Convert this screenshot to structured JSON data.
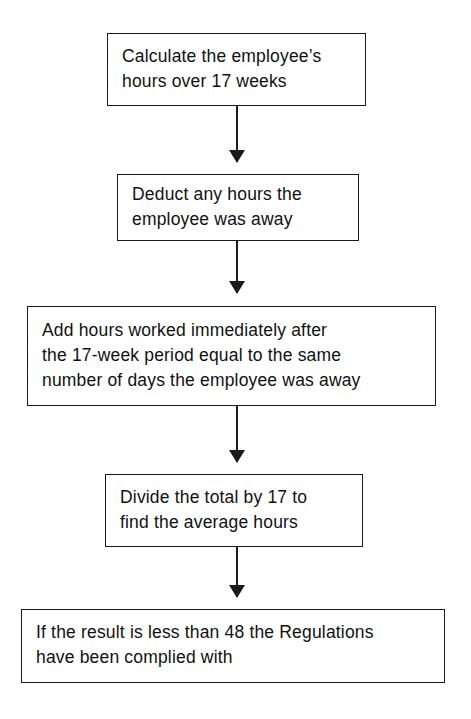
{
  "diagram": {
    "type": "flowchart",
    "orientation": "top-to-bottom",
    "background_color": "#ffffff",
    "line_color": "#1a1a1a",
    "text_color": "#111111",
    "nodes": [
      {
        "id": "node-1",
        "shape": "rectangle",
        "name": "calculate-hours-step",
        "lines": [
          "Calculate the employee’s",
          "hours over 17 weeks"
        ]
      },
      {
        "id": "node-2",
        "shape": "rectangle",
        "name": "deduct-away-hours-step",
        "lines": [
          "Deduct any hours the",
          "employee was away"
        ]
      },
      {
        "id": "node-3",
        "shape": "rectangle",
        "name": "add-hours-worked-step",
        "lines": [
          "Add hours worked immediately after",
          "the 17-week period equal to the same",
          "number of days the employee was away"
        ]
      },
      {
        "id": "node-4",
        "shape": "rectangle",
        "name": "divide-total-step",
        "lines": [
          "Divide the total by 17 to",
          "find the average hours"
        ]
      },
      {
        "id": "node-5",
        "shape": "rectangle",
        "name": "result-compliance-step",
        "lines": [
          "If the result is less than 48 the Regulations",
          "have been complied with"
        ]
      }
    ],
    "connectors": [
      {
        "id": "connector-1",
        "from": "node-1",
        "to": "node-2",
        "style": "solid-line-with-arrowhead"
      },
      {
        "id": "connector-2",
        "from": "node-2",
        "to": "node-3",
        "style": "solid-line-with-arrowhead"
      },
      {
        "id": "connector-3",
        "from": "node-3",
        "to": "node-4",
        "style": "solid-line-with-arrowhead"
      },
      {
        "id": "connector-4",
        "from": "node-4",
        "to": "node-5",
        "style": "solid-line-with-arrowhead"
      }
    ]
  }
}
